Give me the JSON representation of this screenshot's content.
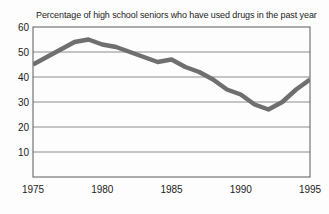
{
  "chart_data": {
    "type": "line",
    "title": "Percentage of high school seniors who have used drugs in the past year",
    "x": [
      1975,
      1976,
      1977,
      1978,
      1979,
      1980,
      1981,
      1982,
      1983,
      1984,
      1985,
      1986,
      1987,
      1988,
      1989,
      1990,
      1991,
      1992,
      1993,
      1994,
      1995
    ],
    "values": [
      45,
      48,
      51,
      54,
      55,
      53,
      52,
      50,
      48,
      46,
      47,
      44,
      42,
      39,
      35,
      33,
      29,
      27,
      30,
      35,
      39
    ],
    "xlabel": "",
    "ylabel": "",
    "xlim": [
      1975,
      1995
    ],
    "ylim": [
      0,
      60
    ],
    "xticks": [
      1975,
      1980,
      1985,
      1990,
      1995
    ],
    "yticks": [
      10,
      20,
      30,
      40,
      50,
      60
    ],
    "grid": "horizontal",
    "legend_position": "none",
    "line_color": "#6f6f6f",
    "line_width": 4.5
  },
  "colors": {
    "background": "#fdfdfd",
    "plot_border": "#5a5a5a",
    "gridline": "#8c8c8c",
    "text": "#1c1c1c"
  }
}
